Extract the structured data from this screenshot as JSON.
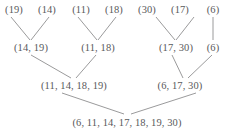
{
  "diagram": {
    "kind": "merge-tree",
    "title": "",
    "line_color": "#8e8e90",
    "text_color": "#59595b",
    "background": "#ffffff",
    "levels": [
      {
        "name": "leaves",
        "nodes": [
          {
            "id": "leaf-19",
            "label": "(19)",
            "x": 14,
            "y": 10
          },
          {
            "id": "leaf-14",
            "label": "(14)",
            "x": 47,
            "y": 10
          },
          {
            "id": "leaf-11",
            "label": "(11)",
            "x": 81,
            "y": 10
          },
          {
            "id": "leaf-18",
            "label": "(18)",
            "x": 114,
            "y": 10
          },
          {
            "id": "leaf-30",
            "label": "(30)",
            "x": 147,
            "y": 10
          },
          {
            "id": "leaf-17",
            "label": "(17)",
            "x": 180,
            "y": 10
          },
          {
            "id": "leaf-6",
            "label": "(6)",
            "x": 213,
            "y": 10
          }
        ]
      },
      {
        "name": "level-two",
        "nodes": [
          {
            "id": "pair-14-19",
            "label": "(14, 19)",
            "x": 31,
            "y": 48
          },
          {
            "id": "pair-11-18",
            "label": "(11, 18)",
            "x": 98,
            "y": 48
          },
          {
            "id": "pair-17-30",
            "label": "(17, 30)",
            "x": 176,
            "y": 48
          },
          {
            "id": "pair-6",
            "label": "(6)",
            "x": 213,
            "y": 48
          }
        ]
      },
      {
        "name": "level-three",
        "nodes": [
          {
            "id": "merge-left",
            "label": "(11, 14, 18, 19)",
            "x": 74,
            "y": 86
          },
          {
            "id": "merge-right",
            "label": "(6, 17, 30)",
            "x": 180,
            "y": 86
          }
        ]
      },
      {
        "name": "root",
        "nodes": [
          {
            "id": "root-all",
            "label": "(6, 11, 14, 17, 18, 19, 30)",
            "x": 127,
            "y": 123
          }
        ]
      }
    ],
    "edges": [
      {
        "id": "e-19-to-pair",
        "from": "leaf-19",
        "to": "pair-14-19",
        "x1": 11,
        "y1": 17,
        "x2": 30,
        "y2": 40
      },
      {
        "id": "e-14-to-pair",
        "from": "leaf-14",
        "to": "pair-14-19",
        "x1": 49,
        "y1": 17,
        "x2": 31,
        "y2": 40
      },
      {
        "id": "e-11-to-pair",
        "from": "leaf-11",
        "to": "pair-11-18",
        "x1": 78,
        "y1": 17,
        "x2": 97,
        "y2": 40
      },
      {
        "id": "e-18-to-pair",
        "from": "leaf-18",
        "to": "pair-11-18",
        "x1": 116,
        "y1": 17,
        "x2": 98,
        "y2": 40
      },
      {
        "id": "e-30-to-pair",
        "from": "leaf-30",
        "to": "pair-17-30",
        "x1": 156,
        "y1": 17,
        "x2": 175,
        "y2": 40
      },
      {
        "id": "e-17-to-pair",
        "from": "leaf-17",
        "to": "pair-17-30",
        "x1": 194,
        "y1": 17,
        "x2": 176,
        "y2": 40
      },
      {
        "id": "e-6-to-single",
        "from": "leaf-6",
        "to": "pair-6",
        "x1": 213,
        "y1": 17,
        "x2": 213,
        "y2": 40
      },
      {
        "id": "e-pair1-merge",
        "from": "pair-14-19",
        "to": "merge-left",
        "x1": 31,
        "y1": 55,
        "x2": 71,
        "y2": 78
      },
      {
        "id": "e-pair2-merge",
        "from": "pair-11-18",
        "to": "merge-left",
        "x1": 96,
        "y1": 55,
        "x2": 76,
        "y2": 78
      },
      {
        "id": "e-pair3-merge",
        "from": "pair-17-30",
        "to": "merge-right",
        "x1": 172,
        "y1": 55,
        "x2": 183,
        "y2": 78
      },
      {
        "id": "e-pair4-merge",
        "from": "pair-6",
        "to": "merge-right",
        "x1": 212,
        "y1": 55,
        "x2": 188,
        "y2": 78
      },
      {
        "id": "e-mergeL-root",
        "from": "merge-left",
        "to": "root-all",
        "x1": 62,
        "y1": 93,
        "x2": 124,
        "y2": 114
      },
      {
        "id": "e-mergeR-root",
        "from": "merge-right",
        "to": "root-all",
        "x1": 196,
        "y1": 93,
        "x2": 131,
        "y2": 114
      }
    ]
  }
}
